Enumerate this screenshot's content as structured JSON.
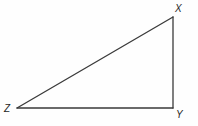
{
  "figure": {
    "name": "right-triangle-xyz",
    "background_color": "#fefefe",
    "stroke_color": "#3a3a3a",
    "label_color": "#262626",
    "stroke_width": 1.3,
    "canvas": {
      "width": 198,
      "height": 126
    },
    "vertices": [
      {
        "id": "X",
        "label": "X",
        "x": 173,
        "y": 17,
        "label_x": 175,
        "label_y": 4,
        "position": "top-right"
      },
      {
        "id": "Y",
        "label": "Y",
        "x": 173,
        "y": 108,
        "label_x": 176,
        "label_y": 110,
        "position": "bottom-right"
      },
      {
        "id": "Z",
        "label": "Z",
        "x": 17,
        "y": 108,
        "label_x": 4,
        "label_y": 104,
        "position": "bottom-left"
      }
    ],
    "edges": [
      {
        "id": "ZX",
        "from": "Z",
        "to": "X",
        "name": "hypotenuse"
      },
      {
        "id": "XY",
        "from": "X",
        "to": "Y",
        "name": "vertical-leg"
      },
      {
        "id": "YZ",
        "from": "Y",
        "to": "Z",
        "name": "horizontal-leg"
      }
    ],
    "right_angle_at": "Y",
    "polygon_points": "17,108 173,17 173,108"
  }
}
